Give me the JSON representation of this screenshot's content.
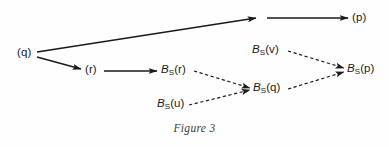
{
  "figure": {
    "caption": "Figure 3",
    "background_color": "#fefefe",
    "stroke_color": "#1a1a1a",
    "width": 389,
    "height": 147
  },
  "nodes": {
    "q": {
      "base": "(q)",
      "sub": "",
      "arg": "",
      "x": 17,
      "y": 47
    },
    "r": {
      "base": "(r)",
      "sub": "",
      "arg": "",
      "x": 85,
      "y": 64
    },
    "p": {
      "base": "(p)",
      "sub": "",
      "arg": "",
      "x": 352,
      "y": 12
    },
    "bsr": {
      "base": "B",
      "sub": "S",
      "arg": "(r)",
      "x": 161,
      "y": 64
    },
    "bsu": {
      "base": "B",
      "sub": "S",
      "arg": "(u)",
      "x": 157,
      "y": 98
    },
    "bsv": {
      "base": "B",
      "sub": "S",
      "arg": "(v)",
      "x": 252,
      "y": 44
    },
    "bsq": {
      "base": "B",
      "sub": "S",
      "arg": "(q)",
      "x": 253,
      "y": 82
    },
    "bsp": {
      "base": "B",
      "sub": "S",
      "arg": "(p)",
      "x": 347,
      "y": 63
    }
  },
  "edges": [
    {
      "name": "q-to-top",
      "from": "q",
      "to": "top-mid",
      "style": "solid",
      "x1": 37,
      "y1": 52,
      "x2": 256,
      "y2": 18
    },
    {
      "name": "top-to-p",
      "from": "top-mid",
      "to": "p",
      "style": "solid",
      "x1": 267,
      "y1": 18,
      "x2": 348,
      "y2": 18
    },
    {
      "name": "q-to-r",
      "from": "q",
      "to": "r",
      "style": "solid",
      "x1": 37,
      "y1": 57,
      "x2": 81,
      "y2": 69
    },
    {
      "name": "r-to-bsr",
      "from": "r",
      "to": "bsr",
      "style": "solid",
      "x1": 104,
      "y1": 71,
      "x2": 157,
      "y2": 71
    },
    {
      "name": "bsr-to-bsq",
      "from": "bsr",
      "to": "bsq",
      "style": "dashed",
      "x1": 194,
      "y1": 71,
      "x2": 250,
      "y2": 88
    },
    {
      "name": "bsu-to-bsq",
      "from": "bsu",
      "to": "bsq",
      "style": "dashed",
      "x1": 189,
      "y1": 105,
      "x2": 250,
      "y2": 90
    },
    {
      "name": "bsv-to-bsp",
      "from": "bsv",
      "to": "bsp",
      "style": "dashed",
      "x1": 288,
      "y1": 51,
      "x2": 344,
      "y2": 68
    },
    {
      "name": "bsq-to-bsp",
      "from": "bsq",
      "to": "bsp",
      "style": "dashed",
      "x1": 288,
      "y1": 89,
      "x2": 344,
      "y2": 72
    }
  ]
}
